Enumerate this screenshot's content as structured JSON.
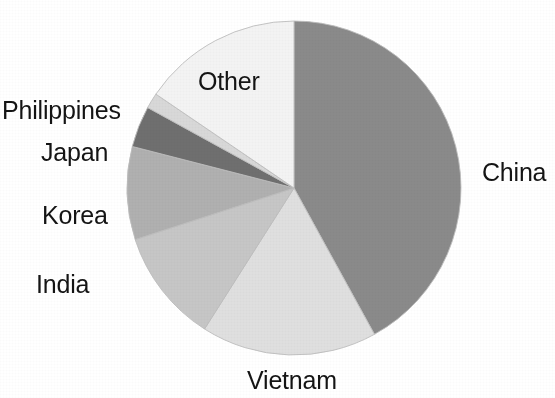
{
  "chart_data": {
    "type": "pie",
    "title": "",
    "subtitle": "",
    "xlabel": "",
    "ylabel": "",
    "legend_position": "none",
    "labels_position": "outside",
    "grid": false,
    "start_angle_deg": 0,
    "direction": "clockwise",
    "center": {
      "x": 294,
      "y": 188
    },
    "radius": 167,
    "categories": [
      "China",
      "Vietnam",
      "India",
      "Korea",
      "Japan",
      "Philippines",
      "Other"
    ],
    "values": [
      42.0,
      17.0,
      11.0,
      9.0,
      4.0,
      1.5,
      15.5
    ],
    "unit": "percent",
    "slices": [
      {
        "label": "China",
        "value": 42.0,
        "color": "#8a8a8a",
        "start_angle_deg": 0,
        "end_angle_deg": 151.2,
        "label_anchor": "start"
      },
      {
        "label": "Vietnam",
        "value": 17.0,
        "color": "#dfdfdf",
        "start_angle_deg": 151.2,
        "end_angle_deg": 212.4,
        "label_anchor": "middle"
      },
      {
        "label": "India",
        "value": 11.0,
        "color": "#c6c6c6",
        "start_angle_deg": 212.4,
        "end_angle_deg": 252.0,
        "label_anchor": "end"
      },
      {
        "label": "Korea",
        "value": 9.0,
        "color": "#b0b0b0",
        "start_angle_deg": 252.0,
        "end_angle_deg": 284.4,
        "label_anchor": "end"
      },
      {
        "label": "Japan",
        "value": 4.0,
        "color": "#6f6f6f",
        "start_angle_deg": 284.4,
        "end_angle_deg": 298.8,
        "label_anchor": "end"
      },
      {
        "label": "Philippines",
        "value": 1.5,
        "color": "#d8d8d8",
        "start_angle_deg": 298.8,
        "end_angle_deg": 304.2,
        "label_anchor": "end"
      },
      {
        "label": "Other",
        "value": 15.5,
        "color": "#f3f3f3",
        "start_angle_deg": 304.2,
        "end_angle_deg": 360.0,
        "label_anchor": "middle"
      }
    ]
  },
  "labels": {
    "china": "China",
    "vietnam": "Vietnam",
    "india": "India",
    "korea": "Korea",
    "japan": "Japan",
    "philippines": "Philippines",
    "other": "Other"
  },
  "colors": {
    "background": "#ffffff",
    "text": "#141414",
    "slice_outline": "#bdbdbd",
    "china": "#8a8a8a",
    "vietnam": "#dfdfdf",
    "india": "#c6c6c6",
    "korea": "#b0b0b0",
    "japan": "#6f6f6f",
    "philippines": "#d8d8d8",
    "other": "#f3f3f3"
  }
}
